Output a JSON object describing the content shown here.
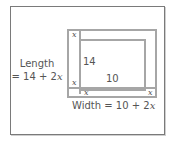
{
  "diagram": {
    "type": "nested-rectangles",
    "length_label": {
      "line1": "Length",
      "line2_prefix": "= 14 + 2",
      "line2_var": "x"
    },
    "width_label": {
      "prefix": "Width = 10 + 2",
      "var": "x"
    },
    "inner_length": "14",
    "inner_width": "10",
    "border_markers": {
      "top_left": "x",
      "left_bottom": "x",
      "bottom_left": "x",
      "bottom_right": "x"
    },
    "colors": {
      "frame": "#7a7a7a",
      "rectangle_lines": "#a6a6a6",
      "text": "#555555",
      "background": "#ffffff"
    }
  }
}
